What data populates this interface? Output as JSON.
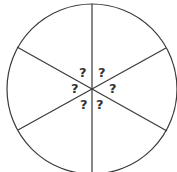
{
  "diagram": {
    "type": "circle-divided-into-sectors",
    "sector_count": 6,
    "stroke_color": "#3a3a3a",
    "text_color": "#333333",
    "labels": [
      "?",
      "?",
      "?",
      "?",
      "?",
      "?"
    ]
  }
}
